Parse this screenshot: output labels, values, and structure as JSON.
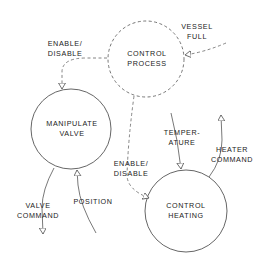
{
  "diagram": {
    "type": "data-flow / control-flow diagram",
    "colors": {
      "stroke": "#555555",
      "text": "#222222",
      "background": "#ffffff"
    },
    "processes": [
      {
        "id": "control-process",
        "line1": "CONTROL",
        "line2": "PROCESS",
        "style": "dashed",
        "cx": 146,
        "cy": 59,
        "r": 38
      },
      {
        "id": "manipulate-valve",
        "line1": "MANIPULATE",
        "line2": "VALVE",
        "style": "solid",
        "cx": 71,
        "cy": 129,
        "r": 40
      },
      {
        "id": "control-heating",
        "line1": "CONTROL",
        "line2": "HEATING",
        "style": "solid",
        "cx": 186,
        "cy": 211,
        "r": 41
      }
    ],
    "flows": [
      {
        "id": "enable-disable-valve",
        "line1": "ENABLE/",
        "line2": "DISABLE",
        "style": "dashed",
        "from": "control-process",
        "to": "manipulate-valve"
      },
      {
        "id": "vessel-full",
        "line1": "VESSEL",
        "line2": "FULL",
        "style": "dashed",
        "from": "external",
        "to": "control-process"
      },
      {
        "id": "enable-disable-heating",
        "line1": "ENABLE/",
        "line2": "DISABLE",
        "style": "dashed",
        "from": "control-process",
        "to": "control-heating"
      },
      {
        "id": "temperature",
        "line1": "TEMPER-",
        "line2": "ATURE",
        "style": "solid",
        "from": "external",
        "to": "control-heating"
      },
      {
        "id": "heater-command",
        "line1": "HEATER",
        "line2": "COMMAND",
        "style": "solid",
        "from": "control-heating",
        "to": "external"
      },
      {
        "id": "valve-command",
        "line1": "VALVE",
        "line2": "COMMAND",
        "style": "solid",
        "from": "manipulate-valve",
        "to": "external"
      },
      {
        "id": "position",
        "line1": "POSITION",
        "line2": "",
        "style": "solid",
        "from": "external",
        "to": "manipulate-valve"
      }
    ]
  }
}
